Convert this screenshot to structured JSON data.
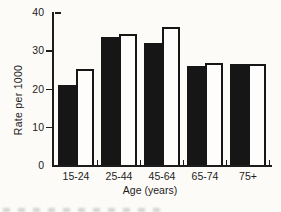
{
  "figure": {
    "background": "#fcfbf8",
    "ink": "#1c1c1c"
  },
  "chart_data": {
    "type": "bar",
    "grouped": true,
    "title": "",
    "xlabel": "Age (years)",
    "ylabel": "Rate per 1000",
    "categories": [
      "15-24",
      "25-44",
      "45-64",
      "65-74",
      "75+"
    ],
    "series": [
      {
        "name": "filled-black",
        "color": "#161616",
        "values": [
          21,
          33.5,
          32,
          26,
          26.4
        ]
      },
      {
        "name": "open-white",
        "color": "#fefdfb",
        "values": [
          25,
          34.3,
          36,
          26.6,
          26.3
        ]
      }
    ],
    "ylim": [
      0,
      40
    ],
    "yticks": [
      0,
      10,
      20,
      30,
      40
    ],
    "grid": false,
    "legend": "none"
  }
}
